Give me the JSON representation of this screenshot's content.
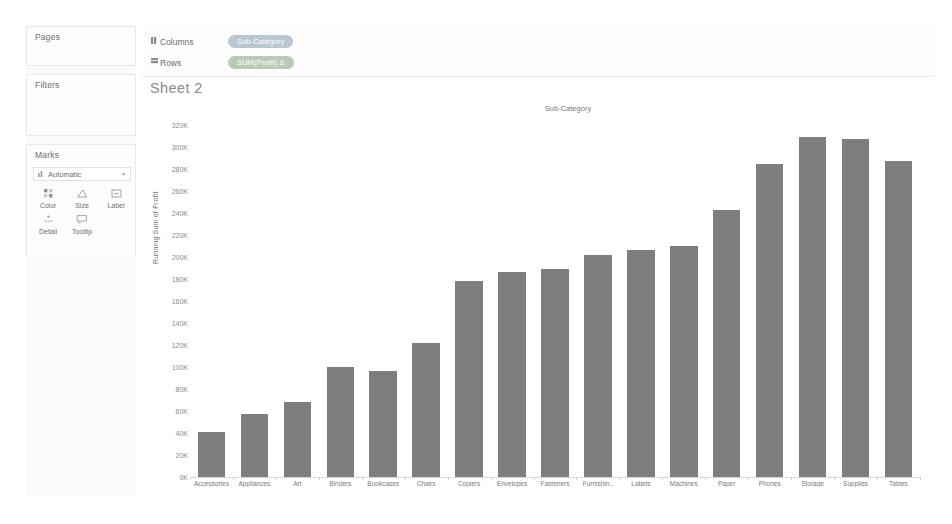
{
  "sidebar": {
    "cards": [
      {
        "title": "Pages"
      },
      {
        "title": "Filters"
      },
      {
        "title": "Marks"
      }
    ],
    "marks": {
      "type_label": "Automatic",
      "type_icon": "bar-mark-icon",
      "caret_icon": "chevron-down-icon",
      "buttons": [
        {
          "label": "Color",
          "icon": "color-icon"
        },
        {
          "label": "Size",
          "icon": "size-icon"
        },
        {
          "label": "Label",
          "icon": "label-icon"
        },
        {
          "label": "Detail",
          "icon": "detail-icon"
        },
        {
          "label": "Tooltip",
          "icon": "tooltip-icon"
        }
      ]
    }
  },
  "shelves": [
    {
      "name": "Columns",
      "icon": "columns-shelf-icon",
      "pill": {
        "text": "Sub-Category",
        "kind": "dimension"
      }
    },
    {
      "name": "Rows",
      "icon": "rows-shelf-icon",
      "pill": {
        "text": "SUM(Profit)  Δ",
        "kind": "measure"
      }
    }
  ],
  "sheet": {
    "title": "Sheet 2",
    "column_header": "Sub-Category"
  },
  "colors": {
    "bar": "#7e7e7e",
    "dimension_pill": "#9fb3c4",
    "measure_pill": "#a3b6a0",
    "axis": "#d9d9d9"
  },
  "chart_data": {
    "type": "bar",
    "title": "Sheet 2",
    "xlabel": "Sub-Category",
    "ylabel": "Running Sum of Profit",
    "ylim": [
      0,
      320000
    ],
    "ytick_step": 20000,
    "ytick_labels": [
      "320K",
      "300K",
      "280K",
      "260K",
      "240K",
      "220K",
      "200K",
      "180K",
      "160K",
      "140K",
      "120K",
      "100K",
      "80K",
      "60K",
      "40K",
      "20K",
      "0K"
    ],
    "ytick_values": [
      320000,
      300000,
      280000,
      260000,
      240000,
      220000,
      200000,
      180000,
      160000,
      140000,
      120000,
      100000,
      80000,
      60000,
      40000,
      20000,
      0
    ],
    "grid": false,
    "legend": "none",
    "categories": [
      "Accessories",
      "Appliances",
      "Art",
      "Binders",
      "Bookcases",
      "Chairs",
      "Copiers",
      "Envelopes",
      "Fasteners",
      "Furnishin..",
      "Labels",
      "Machines",
      "Paper",
      "Phones",
      "Storage",
      "Supplies",
      "Tables"
    ],
    "values": [
      41000,
      57000,
      68000,
      100000,
      96000,
      122000,
      178000,
      186000,
      189000,
      202000,
      206000,
      210000,
      243000,
      285000,
      309000,
      307000,
      287000
    ]
  }
}
